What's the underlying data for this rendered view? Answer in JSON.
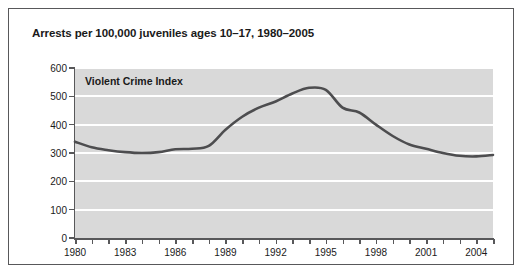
{
  "figure": {
    "title": "Arrests per 100,000 juveniles ages 10–17, 1980–2005",
    "border_color": "#58585a",
    "background": "#ffffff"
  },
  "chart_data": {
    "type": "line",
    "title": "Arrests per 100,000 juveniles ages 10–17, 1980–2005",
    "annotation": "Violent Crime Index",
    "xlabel": "",
    "ylabel": "",
    "xlim": [
      1980,
      2005
    ],
    "ylim": [
      0,
      600
    ],
    "grid": true,
    "grid_color": "#ffffff",
    "plot_background": "#d9d9d9",
    "line_color": "#4d4d4f",
    "legend": null,
    "ytick_labels": [
      "0",
      "100",
      "200",
      "300",
      "400",
      "500",
      "600"
    ],
    "yticks": [
      0,
      100,
      200,
      300,
      400,
      500,
      600
    ],
    "xtick_labels": [
      "1980",
      "1983",
      "1986",
      "1989",
      "1992",
      "1995",
      "1998",
      "2001",
      "2004"
    ],
    "xticks_labeled": [
      1980,
      1983,
      1986,
      1989,
      1992,
      1995,
      1998,
      2001,
      2004
    ],
    "xticks_all": [
      1980,
      1981,
      1982,
      1983,
      1984,
      1985,
      1986,
      1987,
      1988,
      1989,
      1990,
      1991,
      1992,
      1993,
      1994,
      1995,
      1996,
      1997,
      1998,
      1999,
      2000,
      2001,
      2002,
      2003,
      2004,
      2005
    ],
    "x": [
      1980,
      1981,
      1982,
      1983,
      1984,
      1985,
      1986,
      1987,
      1988,
      1989,
      1990,
      1991,
      1992,
      1993,
      1994,
      1995,
      1996,
      1997,
      1998,
      1999,
      2000,
      2001,
      2002,
      2003,
      2004,
      2005
    ],
    "values": [
      340,
      320,
      310,
      303,
      300,
      303,
      313,
      315,
      325,
      382,
      428,
      460,
      482,
      510,
      530,
      523,
      460,
      443,
      400,
      360,
      330,
      315,
      300,
      290,
      288,
      293
    ],
    "series": [
      {
        "name": "Violent Crime Index",
        "values": [
          340,
          320,
          310,
          303,
          300,
          303,
          313,
          315,
          325,
          382,
          428,
          460,
          482,
          510,
          530,
          523,
          460,
          443,
          400,
          360,
          330,
          315,
          300,
          290,
          288,
          293
        ]
      }
    ]
  }
}
